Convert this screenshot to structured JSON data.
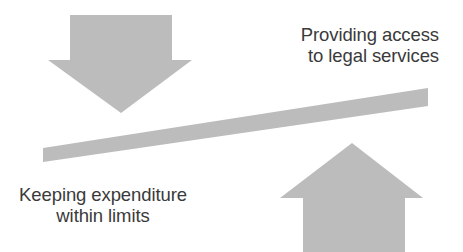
{
  "diagram": {
    "type": "seesaw-balance-diagram",
    "background_color": "#ffffff",
    "shape_color": "#bcbcbc",
    "text_color": "#3a3a3a",
    "captions": {
      "top_right": "Providing access\nto legal services",
      "bottom_left": "Keeping expenditure\nwithin limits"
    },
    "shapes": {
      "down_arrow": {
        "name": "down-arrow",
        "label": "downward arrow above left side of beam",
        "points": "70,15 172,15 172,60 192,60 121,113 48,60 70,60"
      },
      "up_arrow": {
        "name": "up-arrow",
        "label": "upward arrow below right side of beam",
        "points": "352,143 423,198 405,198 405,252 303,252 303,198 280,198"
      },
      "beam": {
        "name": "seesaw-beam",
        "label": "tilted beam rising to the right",
        "points": "43,148 428,88 428,106 43,162"
      }
    }
  }
}
